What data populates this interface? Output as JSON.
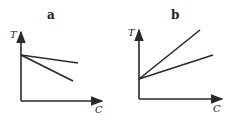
{
  "panels": [
    {
      "title": "a",
      "y_axis": "T",
      "x_axis": "C",
      "description": "Two lines from common origin on T axis, both decreasing with C, different slopes"
    },
    {
      "title": "b",
      "y_axis": "T",
      "x_axis": "C",
      "description": "Two lines from common origin on T axis, both increasing with C, different slopes"
    }
  ],
  "colors": {
    "stroke": "#2a2a2a",
    "background": "#ffffff"
  }
}
